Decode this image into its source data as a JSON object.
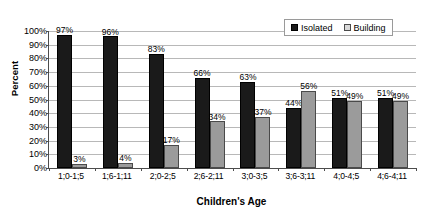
{
  "chart_data": {
    "type": "bar",
    "title": "",
    "xlabel": "Children's Age",
    "ylabel": "Percent",
    "ylim": [
      0,
      100
    ],
    "ytick_labels": [
      "100%",
      "90%",
      "80%",
      "70%",
      "60%",
      "50%",
      "40%",
      "30%",
      "20%",
      "10%",
      "0%"
    ],
    "ytick_values": [
      100,
      90,
      80,
      70,
      60,
      50,
      40,
      30,
      20,
      10,
      0
    ],
    "grid": true,
    "legend_position": "top-right",
    "categories": [
      "1;0-1;5",
      "1;6-1;11",
      "2;0-2;5",
      "2;6-2;11",
      "3;0-3;5",
      "3;6-3;11",
      "4;0-4;5",
      "4;6-4;11"
    ],
    "series": [
      {
        "name": "Isolated",
        "color": "#1a1a1a",
        "values": [
          97,
          96,
          83,
          66,
          63,
          44,
          51,
          51
        ],
        "labels": [
          "97%",
          "96%",
          "83%",
          "66%",
          "63%",
          "44%",
          "51%",
          "51%"
        ]
      },
      {
        "name": "Building",
        "color": "#9b9b9b",
        "values": [
          3,
          4,
          17,
          34,
          37,
          56,
          49,
          49
        ],
        "labels": [
          "3%",
          "4%",
          "17%",
          "34%",
          "37%",
          "56%",
          "49%",
          "49%"
        ]
      }
    ]
  },
  "legend": {
    "items": [
      {
        "label": "Isolated",
        "swatch": "isolated"
      },
      {
        "label": "Building",
        "swatch": "building"
      }
    ]
  }
}
